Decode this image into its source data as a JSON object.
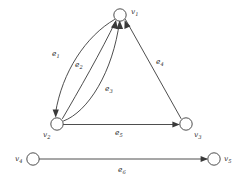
{
  "figure": {
    "type": "directed-multigraph",
    "background_color": "#ffffff",
    "stroke_color": "#3a3a3a",
    "text_color": "#2b2b2b"
  },
  "nodes": [
    {
      "id": "v1",
      "label": "v",
      "subscript": "1",
      "cx": 120,
      "cy": 15,
      "r": 6.2,
      "label_x": 131,
      "label_y": 14
    },
    {
      "id": "v2",
      "label": "v",
      "subscript": "2",
      "cx": 57,
      "cy": 124,
      "r": 6.2,
      "label_x": 44,
      "label_y": 136
    },
    {
      "id": "v3",
      "label": "v",
      "subscript": "3",
      "cx": 186,
      "cy": 124,
      "r": 6.2,
      "label_x": 194,
      "label_y": 136
    },
    {
      "id": "v4",
      "label": "v",
      "subscript": "4",
      "cx": 33,
      "cy": 159,
      "r": 6.2,
      "label_x": 16,
      "label_y": 160
    },
    {
      "id": "v5",
      "label": "v",
      "subscript": "5",
      "cx": 214,
      "cy": 159,
      "r": 6.2,
      "label_x": 224,
      "label_y": 160
    }
  ],
  "edges": [
    {
      "id": "e1",
      "label": "e",
      "subscript": "1",
      "from": "v1",
      "to": "v2",
      "shape": "curve-left",
      "label_x": 55,
      "label_y": 55
    },
    {
      "id": "e2",
      "label": "e",
      "subscript": "2",
      "from": "v2",
      "to": "v1",
      "shape": "curve-mid",
      "label_x": 78,
      "label_y": 66
    },
    {
      "id": "e3",
      "label": "e",
      "subscript": "3",
      "from": "v2",
      "to": "v1",
      "shape": "curve-right",
      "label_x": 108,
      "label_y": 90
    },
    {
      "id": "e4",
      "label": "e",
      "subscript": "4",
      "from": "v1",
      "to": "v3",
      "shape": "straight",
      "label_x": 159,
      "label_y": 63
    },
    {
      "id": "e5",
      "label": "e",
      "subscript": "5",
      "from": "v2",
      "to": "v3",
      "shape": "straight",
      "label_x": 118,
      "label_y": 134
    },
    {
      "id": "e6",
      "label": "e",
      "subscript": "6",
      "from": "v4",
      "to": "v5",
      "shape": "straight",
      "label_x": 121,
      "label_y": 171
    }
  ],
  "geometry": {
    "e1_path": "M 114.5 19.5 C 86 36, 62 72, 55.5 113",
    "e2_path": "M 62.5 118.5 C 78 92, 102 50, 115.5 21.5",
    "e3_path": "M 63.5 121 C 88 112, 113 72, 119.5 21.5",
    "e4_path": "M 125.5 19.5 L 181 118.5",
    "e5_path": "M 63.5 124.5 L 178 124.5",
    "e6_path": "M 39.5 159 L 206.5 159",
    "arrow_e1": "M 55.7 117.8 L 52.6 109.6 L 58.9 109.4 Z",
    "arrow_e2": "M 116.0 20.0 L 111.0 27.5 L 117.9 29.2 Z",
    "arrow_e3": "M 119.8 20.5 L 116.3 28.9 L 123.1 28.9 Z",
    "arrow_e4": "M 124.6 20.2 L 124.4 29.0 L 130.5 26.2 Z",
    "arrow_e5": "M 179.8 124.5 L 172.4 121.5 L 172.4 127.5 Z",
    "arrow_e6": "M 208.0 159.0 L 200.6 156.0 L 200.6 162.0 Z"
  }
}
